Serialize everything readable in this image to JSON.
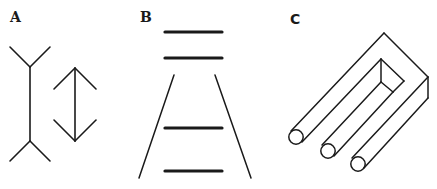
{
  "figure": {
    "panels": [
      {
        "label": "A",
        "name": "Müller-Lyer illusion"
      },
      {
        "label": "B",
        "name": "Ponzo illusion"
      },
      {
        "label": "C",
        "name": "Impossible trident"
      }
    ]
  },
  "colors": {
    "ink": "#1a1a1a",
    "background": "#ffffff"
  }
}
